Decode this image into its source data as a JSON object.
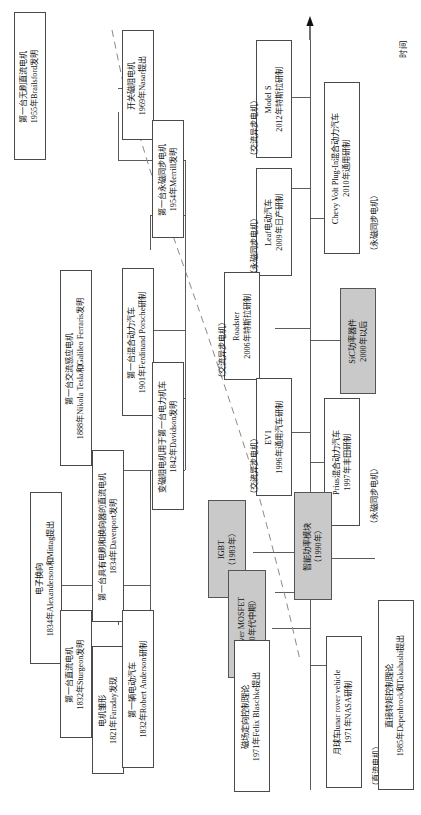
{
  "diagram": {
    "axis_label": "时间",
    "orientation": "vertical-text-rotated-90",
    "colors": {
      "box_border": "#4a4a4a",
      "box_fill": "#ffffff",
      "highlight_fill": "#c9c9c9",
      "line": "#4a4a4a",
      "dashed_line": "#8a8a8a"
    },
    "nodes": [
      {
        "id": "faraday",
        "highlight": false,
        "lines": [
          "电机雏形",
          "1821年Faraday发现"
        ]
      },
      {
        "id": "sturgeon",
        "highlight": false,
        "lines": [
          "第一台直流电机",
          "1832年Sturgeon发明"
        ]
      },
      {
        "id": "anderson",
        "highlight": false,
        "lines": [
          "第一辆电动汽车",
          "1832年Robert Anderson研制"
        ]
      },
      {
        "id": "alexanderson",
        "highlight": false,
        "lines": [
          "电子换向",
          "1834年Alexanderson和Mittag提出"
        ]
      },
      {
        "id": "davenport",
        "highlight": false,
        "lines": [
          "第一台具有电刷和换向器的直流电机",
          "1834年Davenport发明"
        ]
      },
      {
        "id": "davidson",
        "highlight": false,
        "lines": [
          "变磁阻电机用于第一台电力机车",
          "1842年Davidson发明"
        ]
      },
      {
        "id": "tesla",
        "highlight": false,
        "lines": [
          "第一台交流感应电机",
          "1888年Nikola Tesla和Galileo Ferraris发明"
        ]
      },
      {
        "id": "porsche",
        "highlight": false,
        "lines": [
          "第一台混合动力汽车",
          "1901年Ferdinand Porsche研制"
        ]
      },
      {
        "id": "merrill",
        "highlight": false,
        "lines": [
          "第一台永磁同步电机",
          "1954年Merrill发明"
        ]
      },
      {
        "id": "brailsford",
        "highlight": false,
        "lines": [
          "第一台无刷直流电机",
          "1955年Brailsford发明"
        ]
      },
      {
        "id": "nasar",
        "highlight": false,
        "lines": [
          "开关磁阻电机",
          "1969年Nasar提出"
        ]
      },
      {
        "id": "blaschke",
        "highlight": false,
        "lines": [
          "磁场定向控制理论",
          "1971年Felix Blaschke提出"
        ]
      },
      {
        "id": "lunar",
        "highlight": false,
        "lines": [
          "月球车lunar rover vehicle",
          "1971年NASA研制"
        ]
      },
      {
        "id": "mosfet",
        "highlight": true,
        "lines": [
          "Power MOSFET",
          "（70年代中期）"
        ]
      },
      {
        "id": "igbt",
        "highlight": true,
        "lines": [
          "IGBT",
          "（1983年）"
        ]
      },
      {
        "id": "dtc",
        "highlight": false,
        "lines": [
          "直接转矩控制理论",
          "1985年Depenbrock和Takahashi提出"
        ]
      },
      {
        "id": "ipm",
        "highlight": true,
        "lines": [
          "智能功率模块",
          "（1990年）"
        ]
      },
      {
        "id": "ev1",
        "highlight": false,
        "lines": [
          "EV1",
          "1996年通用汽车研制"
        ]
      },
      {
        "id": "prius",
        "highlight": false,
        "lines": [
          "Prius混合动力汽车",
          "1997年丰田研制"
        ]
      },
      {
        "id": "sic",
        "highlight": true,
        "lines": [
          "SiC功率器件",
          "2000年以后"
        ]
      },
      {
        "id": "roadster",
        "highlight": false,
        "lines": [
          "Roadster",
          "2006年特斯拉研制"
        ]
      },
      {
        "id": "leaf",
        "highlight": false,
        "lines": [
          "Leaf电动汽车",
          "2009年日产研制"
        ]
      },
      {
        "id": "volt",
        "highlight": false,
        "lines": [
          "Chevy Volt Plug-In混合动力汽车",
          "2010年通用研制"
        ]
      },
      {
        "id": "models",
        "highlight": false,
        "lines": [
          "Model S",
          "2012年特斯拉研制"
        ]
      }
    ],
    "annotations": [
      {
        "id": "anno-roadster",
        "text": "（交流异步电机）"
      },
      {
        "id": "anno-ev1",
        "text": "（交流异步电机）"
      },
      {
        "id": "anno-leaf",
        "text": "（永磁同步电机）"
      },
      {
        "id": "anno-models",
        "text": "（交流异步电机）"
      },
      {
        "id": "anno-volt",
        "text": "（永磁同步电机）"
      },
      {
        "id": "anno-prius",
        "text": "（永磁同步电机）"
      },
      {
        "id": "anno-lunar",
        "text": "（直流电机）"
      }
    ]
  }
}
